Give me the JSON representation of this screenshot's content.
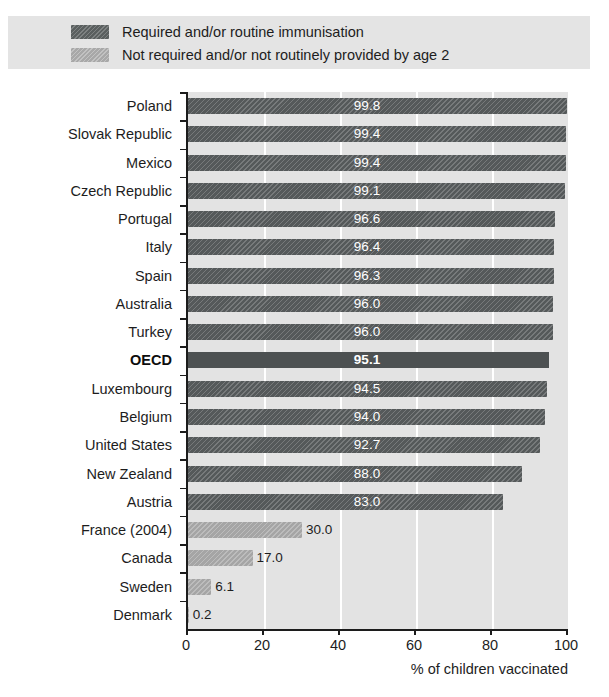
{
  "title": "Figure 1.1. Measles immunisation rates, 2005 (or latest year available)",
  "legend": {
    "items": [
      {
        "label": "Required and/or routine immunisation",
        "swatch": "dark-hatched-swatch",
        "color": "#5a5f5f"
      },
      {
        "label": "Not required and/or not routinely provided by age 2",
        "swatch": "light-hatched-swatch",
        "color": "#a8a8a8"
      }
    ]
  },
  "axis": {
    "x_title": "% of children vaccinated",
    "x_ticks": [
      "0",
      "20",
      "40",
      "60",
      "80",
      "100"
    ]
  },
  "chart_data": {
    "type": "bar",
    "orientation": "horizontal",
    "title": "Figure 1.1. Measles immunisation rates, 2005 (or latest year available)",
    "xlabel": "% of children vaccinated",
    "ylabel": "",
    "xlim": [
      0,
      100
    ],
    "xticks": [
      0,
      20,
      40,
      60,
      80,
      100
    ],
    "grid": "vertical-white-gridlines",
    "legend_position": "top",
    "categories": [
      "Poland",
      "Slovak Republic",
      "Mexico",
      "Czech Republic",
      "Portugal",
      "Italy",
      "Spain",
      "Australia",
      "Turkey",
      "OECD",
      "Luxembourg",
      "Belgium",
      "United States",
      "New Zealand",
      "Austria",
      "France (2004)",
      "Canada",
      "Sweden",
      "Denmark"
    ],
    "values": [
      99.8,
      99.4,
      99.4,
      99.1,
      96.6,
      96.4,
      96.3,
      96.0,
      96.0,
      95.1,
      94.5,
      94.0,
      92.7,
      88.0,
      83.0,
      30.0,
      17.0,
      6.1,
      0.2
    ],
    "value_labels": [
      "99.8",
      "99.4",
      "99.4",
      "99.1",
      "96.6",
      "96.4",
      "96.3",
      "96.0",
      "96.0",
      "95.1",
      "94.5",
      "94.0",
      "92.7",
      "88.0",
      "83.0",
      "30.0",
      "17.0",
      "6.1",
      "0.2"
    ],
    "series_group": [
      "required",
      "required",
      "required",
      "required",
      "required",
      "required",
      "required",
      "required",
      "required",
      "required",
      "required",
      "required",
      "required",
      "required",
      "required",
      "not-required",
      "not-required",
      "not-required",
      "not-required"
    ],
    "highlight": "OECD",
    "series": [
      {
        "name": "Required and/or routine immunisation",
        "color": "#55595a"
      },
      {
        "name": "Not required and/or not routinely provided by age 2",
        "color": "#a5a5a5"
      }
    ]
  }
}
